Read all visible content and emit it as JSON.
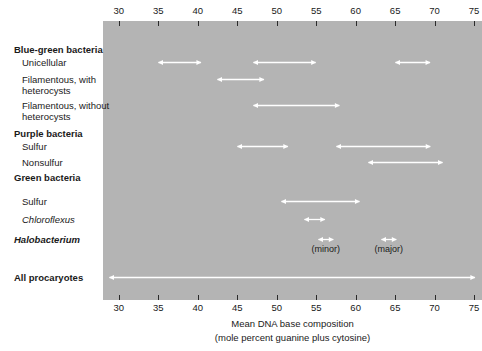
{
  "chart_data": {
    "type": "bar",
    "title": "",
    "xlabel": "Mean DNA base composition (mole percent guanine plus cytosine)",
    "xlabel_line1": "Mean DNA base composition",
    "xlabel_line2": "(mole percent guanine plus cytosine)",
    "ylabel": "",
    "xlim": [
      28,
      76
    ],
    "grid": false,
    "legend": "none",
    "axis_ticks": [
      30,
      35,
      40,
      45,
      50,
      55,
      60,
      65,
      70,
      75
    ],
    "tick_labels": [
      "30",
      "35",
      "40",
      "45",
      "50",
      "55",
      "60",
      "65",
      "70",
      "75"
    ],
    "panel_color": "#b4b4b4",
    "arrow_color": "#ffffff",
    "categories": [
      "Blue-green bacteria",
      "Unicellular",
      "Filamentous, with heterocysts",
      "Filamentous, without heterocysts",
      "Purple bacteria",
      "Sulfur",
      "Nonsulfur",
      "Green bacteria",
      "Sulfur",
      "Chloroflexus",
      "Halobacterium",
      "All procaryotes"
    ],
    "rows": [
      {
        "label": "Blue-green bacteria",
        "style": "group",
        "ranges": []
      },
      {
        "label": "Unicellular",
        "style": "indent",
        "ranges": [
          [
            35.0,
            40.5
          ],
          [
            47.0,
            55.0
          ],
          [
            65.0,
            69.5
          ]
        ]
      },
      {
        "label": "Filamentous, with\nheterocysts",
        "style": "indent",
        "ranges": [
          [
            42.5,
            48.5
          ]
        ]
      },
      {
        "label": "Filamentous, without\nheterocysts",
        "style": "indent",
        "ranges": [
          [
            47.0,
            58.0
          ]
        ]
      },
      {
        "label": "Purple bacteria",
        "style": "group",
        "ranges": []
      },
      {
        "label": "Sulfur",
        "style": "indent",
        "ranges": [
          [
            45.0,
            51.5
          ],
          [
            57.5,
            69.5
          ]
        ]
      },
      {
        "label": "Nonsulfur",
        "style": "indent",
        "ranges": [
          [
            61.5,
            71.0
          ]
        ]
      },
      {
        "label": "Green bacteria",
        "style": "group",
        "ranges": []
      },
      {
        "label": "Sulfur",
        "style": "indent",
        "ranges": [
          [
            50.5,
            60.5
          ]
        ]
      },
      {
        "label": "Chloroflexus",
        "style": "italic",
        "ranges": [
          [
            53.5,
            56.2
          ]
        ]
      },
      {
        "label": "Halobacterium",
        "style": "bolditalic",
        "ranges": [
          [
            55.2,
            57.2
          ],
          [
            63.2,
            65.2
          ]
        ]
      },
      {
        "label": "All procaryotes",
        "style": "strong",
        "ranges": [
          [
            28.8,
            75.2
          ]
        ]
      }
    ],
    "annotations": [
      {
        "text": "(minor)",
        "x": 56.2
      },
      {
        "text": "(major)",
        "x": 64.2
      }
    ]
  }
}
